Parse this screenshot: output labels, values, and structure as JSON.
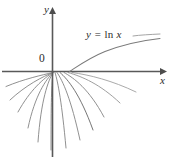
{
  "figure": {
    "background_color": "#ffffff",
    "width": 171,
    "height": 158
  },
  "axes": {
    "x_label": "x",
    "y_label": "y",
    "origin_label": "0",
    "color": "#595959",
    "origin_px": {
      "x": 52,
      "y": 71
    },
    "x_axis_y_px": 71,
    "y_axis_x_px": 52,
    "x_arrow_end_px": 163,
    "y_arrow_end_px": 12
  },
  "labels": {
    "equation": "y = ln x",
    "equation_variable": "y = ",
    "equation_function": "ln",
    "equation_argument": " x",
    "equation_color": "#2b2b2b"
  },
  "chart_data": {
    "type": "line",
    "title": "",
    "xlabel": "x",
    "ylabel": "y",
    "grid": false,
    "legend": "none",
    "annotations": [
      {
        "text": "y = ln x",
        "x_px": 86,
        "y_px": 29
      },
      {
        "text": "0",
        "x_px": 39,
        "y_px": 53
      }
    ],
    "xlim": [
      -2.6,
      5.5
    ],
    "ylim": [
      -4.2,
      1.6
    ],
    "series": [
      {
        "name": "y = ln x",
        "kind": "logarithm",
        "color": "#7a7a7a",
        "stroke_width": 1.05,
        "path": "M 69.5 71.5 C 78 66 90 57.5 105 51.5 C 122 45 142 40.5 160 38.5"
      },
      {
        "name": "fan-curve-1",
        "kind": "family-member",
        "color": "#8a8a8a",
        "path": "M 53 72.5 C 42 75 24 79 6 86.5"
      },
      {
        "name": "fan-curve-2",
        "kind": "family-member",
        "color": "#8a8a8a",
        "path": "M 53 72.5 C 43 76.5 26 85 10 100"
      },
      {
        "name": "fan-curve-3",
        "kind": "family-member",
        "color": "#8a8a8a",
        "path": "M 53 72.5 C 44 78 30 90 18 112"
      },
      {
        "name": "fan-curve-4",
        "kind": "family-member",
        "color": "#8a8a8a",
        "path": "M 53 72.5 C 46 79.5 35 95 28 128"
      },
      {
        "name": "fan-curve-5",
        "kind": "family-member",
        "color": "#8a8a8a",
        "path": "M 53 72.5 C 48 81 41 100 38 142"
      },
      {
        "name": "fan-curve-6",
        "kind": "family-member",
        "color": "#8a8a8a",
        "path": "M 53 72.5 C 51.5 82 51 104 51 150"
      },
      {
        "name": "fan-curve-7",
        "kind": "family-member",
        "color": "#8a8a8a",
        "path": "M 55 72.5 C 58 82 62 104 66 148"
      },
      {
        "name": "fan-curve-8",
        "kind": "family-member",
        "color": "#8a8a8a",
        "path": "M 57 72.5 C 63 81 71 99 80 140"
      },
      {
        "name": "fan-curve-9",
        "kind": "family-member",
        "color": "#6e6e6e",
        "path": "M 60 72.5 C 68 79.5 80 94 93 130"
      },
      {
        "name": "fan-curve-10",
        "kind": "family-member",
        "color": "#8a8a8a",
        "path": "M 64 72.5 C 74 78 89 89 104 117"
      },
      {
        "name": "fan-curve-11",
        "kind": "family-member",
        "color": "#9a9a9a",
        "path": "M 68 72.5 C 82 76.5 100 84 120 103"
      },
      {
        "name": "fan-curve-12",
        "kind": "family-member",
        "color": "#a5a5a5",
        "path": "M 72 72.5 C 90 75 112 80.5 136 92"
      }
    ]
  }
}
